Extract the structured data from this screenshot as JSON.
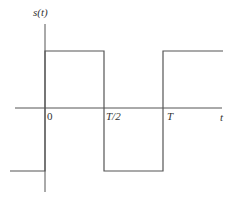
{
  "diagram": {
    "type": "square-wave",
    "colors": {
      "line": "#555555",
      "text": "#333333",
      "background": "#ffffff"
    },
    "labels": {
      "y_axis": "s(t)",
      "x_axis": "t",
      "origin": "0",
      "half_period": "T/2",
      "period": "T"
    },
    "segments": [
      {
        "name": "left-low",
        "level": "low",
        "from": "before 0",
        "to": "0"
      },
      {
        "name": "first-high",
        "level": "high",
        "from": "0",
        "to": "T/2"
      },
      {
        "name": "low",
        "level": "low",
        "from": "T/2",
        "to": "T"
      },
      {
        "name": "second-high",
        "level": "high",
        "from": "T",
        "to": "after T"
      }
    ]
  }
}
